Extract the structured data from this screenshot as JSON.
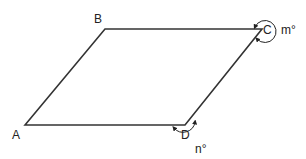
{
  "diagram": {
    "type": "parallelogram",
    "vertices": [
      {
        "id": "A",
        "label": "A",
        "x": 25,
        "y": 125,
        "label_x": 12,
        "label_y": 139
      },
      {
        "id": "B",
        "label": "B",
        "x": 105,
        "y": 29,
        "label_x": 94,
        "label_y": 23
      },
      {
        "id": "C",
        "label": "C",
        "x": 262,
        "y": 29,
        "label_x": 263,
        "label_y": 34
      },
      {
        "id": "D",
        "label": "D",
        "x": 185,
        "y": 125,
        "label_x": 181,
        "label_y": 139
      }
    ],
    "angles": [
      {
        "vertex": "C",
        "label": "m°",
        "kind": "reflex",
        "label_x": 281,
        "label_y": 34
      },
      {
        "vertex": "D",
        "label": "n°",
        "kind": "exterior",
        "label_x": 195,
        "label_y": 153
      }
    ],
    "stroke_color": "#333333",
    "label_color": "#222222"
  }
}
